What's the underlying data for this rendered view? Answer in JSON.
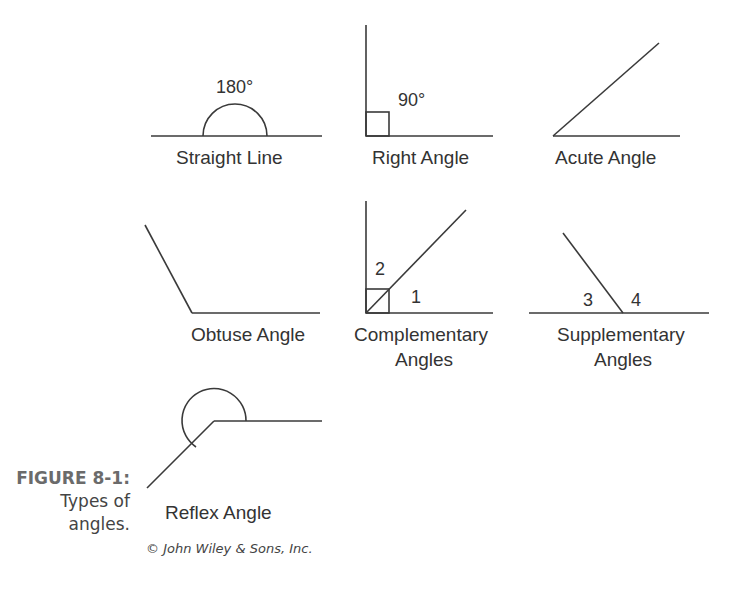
{
  "figure": {
    "number": "FIGURE 8-1:",
    "caption_line1": "Types of",
    "caption_line2": "angles.",
    "credit": "© John Wiley & Sons, Inc."
  },
  "diagrams": {
    "straight_line": {
      "label": "Straight Line",
      "measure": "180°"
    },
    "right_angle": {
      "label": "Right Angle",
      "measure": "90°"
    },
    "acute_angle": {
      "label": "Acute Angle"
    },
    "obtuse_angle": {
      "label": "Obtuse Angle"
    },
    "complementary": {
      "label_line1": "Complementary",
      "label_line2": "Angles",
      "angle_a": "2",
      "angle_b": "1"
    },
    "supplementary": {
      "label_line1": "Supplementary",
      "label_line2": "Angles",
      "angle_a": "3",
      "angle_b": "4"
    },
    "reflex_angle": {
      "label": "Reflex Angle"
    }
  },
  "colors": {
    "line": "#3a3a3a",
    "text": "#333333",
    "caption_head": "#6b6b6b"
  }
}
